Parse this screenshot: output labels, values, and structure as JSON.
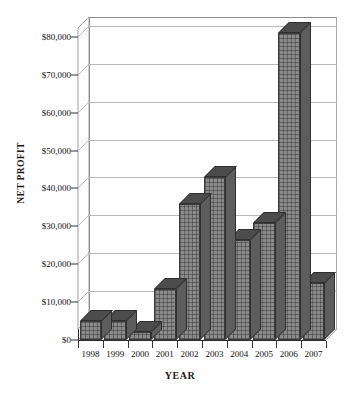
{
  "chart_data": {
    "type": "bar",
    "title": "",
    "xlabel": "YEAR",
    "ylabel": "NET PROFIT",
    "categories": [
      "1998",
      "1999",
      "2000",
      "2001",
      "2002",
      "2003",
      "2004",
      "2005",
      "2006",
      "2007"
    ],
    "values": [
      5000,
      5000,
      2000,
      13500,
      36000,
      43000,
      26500,
      31000,
      81000,
      15000
    ],
    "ylim": [
      0,
      85000
    ],
    "ytick_values": [
      0,
      10000,
      20000,
      30000,
      40000,
      50000,
      60000,
      70000,
      80000
    ],
    "ytick_labels": [
      "$0",
      "$10,000",
      "$20,000",
      "$30,000",
      "$40,000",
      "$50,000",
      "$60,000",
      "$70,000",
      "$80,000"
    ],
    "grid": true,
    "legend": "none",
    "style": "3d-column",
    "series": [
      {
        "name": "Net Profit",
        "values": [
          5000,
          5000,
          2000,
          13500,
          36000,
          43000,
          26500,
          31000,
          81000,
          15000
        ]
      }
    ],
    "colors": {
      "bar_face": "#8a8a8a",
      "bar_top": "#4c4c4c",
      "bar_side": "#5d5d5d",
      "bar_outline": "#3a3a3a",
      "gridline": "#b9b9b9",
      "axis": "#2b2b2b",
      "background": "#ffffff",
      "text": "#111111"
    }
  }
}
